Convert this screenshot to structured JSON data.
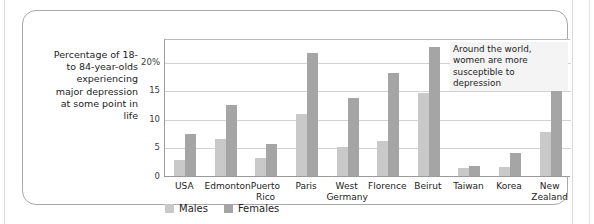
{
  "figure": {
    "axis_caption": "Percentage of 18- to 84-year-olds experiencing major depression at some point in life",
    "annotation": "Around the world, women are more susceptible to depression"
  },
  "legend": {
    "position": "bottom-left",
    "items": [
      {
        "label": "Males",
        "color": "#c9c9c9"
      },
      {
        "label": "Females",
        "color": "#a5a5a5"
      }
    ]
  },
  "chart_data": {
    "type": "bar",
    "title": "",
    "subtitle": "",
    "xlabel": "",
    "ylabel": "Percentage of 18- to 84-year-olds experiencing major depression at some point in life",
    "ylim": [
      0,
      24
    ],
    "yticks": [
      0,
      5,
      10,
      15,
      20
    ],
    "ytick_labels": [
      "0",
      "5",
      "10",
      "15",
      "20%"
    ],
    "grid": true,
    "annotations": [
      "Around the world, women are more susceptible to depression"
    ],
    "categories": [
      "USA",
      "Edmonton",
      "Puerto Rico",
      "Paris",
      "West Germany",
      "Florence",
      "Beirut",
      "Taiwan",
      "Korea",
      "New Zealand"
    ],
    "category_labels": [
      [
        "USA"
      ],
      [
        "Edmonton"
      ],
      [
        "Puerto",
        "Rico"
      ],
      [
        "Paris"
      ],
      [
        "West",
        "Germany"
      ],
      [
        "Florence"
      ],
      [
        "Beirut"
      ],
      [
        "Taiwan"
      ],
      [
        "Korea"
      ],
      [
        "New",
        "Zealand"
      ]
    ],
    "series": [
      {
        "name": "Males",
        "color": "#c9c9c9",
        "values": [
          2.8,
          6.5,
          3.1,
          10.8,
          5.0,
          6.1,
          14.6,
          1.4,
          1.5,
          7.7
        ]
      },
      {
        "name": "Females",
        "color": "#a5a5a5",
        "values": [
          7.3,
          12.4,
          5.6,
          21.5,
          13.7,
          18.0,
          22.6,
          1.7,
          4.0,
          15.5
        ]
      }
    ]
  }
}
